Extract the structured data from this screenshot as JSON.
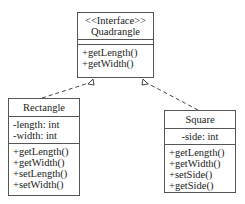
{
  "diagram": {
    "type": "UML class diagram",
    "interface": {
      "stereotype": "<<Interface>>",
      "name": "Quadrangle",
      "attributes": [],
      "methods": [
        "+getLength()",
        "+getWidth()"
      ]
    },
    "classes": [
      {
        "name": "Rectangle",
        "attributes": [
          "-length: int",
          "-width: int"
        ],
        "methods": [
          "+getLength()",
          "+getWidth()",
          "+setLength()",
          "+setWidth()"
        ]
      },
      {
        "name": "Square",
        "attributes": [
          "-side: int"
        ],
        "methods": [
          "+getLength()",
          "+getWidth()",
          "+setSide()",
          "+getSide()"
        ]
      }
    ],
    "relations": [
      {
        "from": "Rectangle",
        "to": "Quadrangle",
        "type": "realization"
      },
      {
        "from": "Square",
        "to": "Quadrangle",
        "type": "realization"
      }
    ]
  }
}
